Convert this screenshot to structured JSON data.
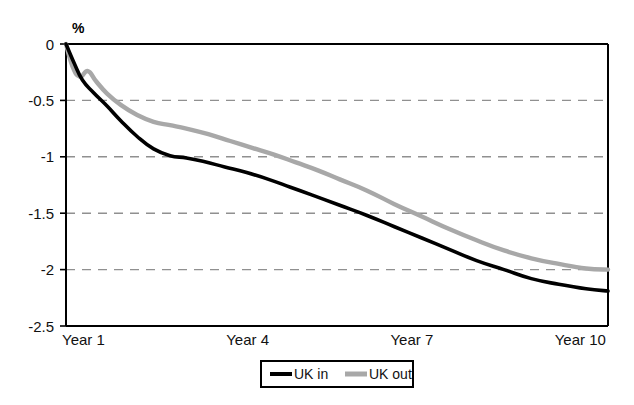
{
  "chart_data": {
    "type": "line",
    "title": "",
    "xlabel": "",
    "ylabel": "%",
    "ylim": [
      -2.5,
      0
    ],
    "xlim": [
      1,
      10.9
    ],
    "grid": true,
    "grid_axis": "y",
    "legend_position": "bottom-center",
    "ytick_labels": [
      "0",
      "-0.5",
      "-1",
      "-1.5",
      "-2",
      "-2.5"
    ],
    "ytick_values": [
      0,
      -0.5,
      -1,
      -1.5,
      -2,
      -2.5
    ],
    "xtick_labels": [
      "Year 1",
      "Year 4",
      "Year 7",
      "Year 10"
    ],
    "xtick_values": [
      1,
      4,
      7,
      10
    ],
    "series": [
      {
        "name": "UK in",
        "color": "#000000",
        "x": [
          1.0,
          1.15,
          1.3,
          1.5,
          1.75,
          2.0,
          2.3,
          2.6,
          2.9,
          3.2,
          3.5,
          3.9,
          4.3,
          4.7,
          5.1,
          5.5,
          6.0,
          6.5,
          7.0,
          7.5,
          8.0,
          8.5,
          9.0,
          9.5,
          10.0,
          10.5,
          10.9
        ],
        "values": [
          0.0,
          -0.17,
          -0.32,
          -0.43,
          -0.55,
          -0.68,
          -0.82,
          -0.93,
          -0.99,
          -1.01,
          -1.04,
          -1.09,
          -1.14,
          -1.2,
          -1.27,
          -1.34,
          -1.43,
          -1.52,
          -1.62,
          -1.72,
          -1.82,
          -1.92,
          -2.0,
          -2.08,
          -2.13,
          -2.17,
          -2.19
        ]
      },
      {
        "name": "UK out",
        "color": "#a8a8a8",
        "x": [
          1.0,
          1.12,
          1.25,
          1.4,
          1.55,
          1.75,
          2.0,
          2.3,
          2.6,
          2.9,
          3.2,
          3.6,
          4.0,
          4.4,
          4.8,
          5.2,
          5.6,
          6.0,
          6.5,
          7.0,
          7.5,
          8.0,
          8.5,
          9.0,
          9.5,
          10.0,
          10.5,
          10.9
        ],
        "values": [
          0.0,
          -0.2,
          -0.29,
          -0.24,
          -0.33,
          -0.44,
          -0.54,
          -0.63,
          -0.69,
          -0.72,
          -0.75,
          -0.8,
          -0.86,
          -0.92,
          -0.98,
          -1.05,
          -1.12,
          -1.2,
          -1.3,
          -1.42,
          -1.53,
          -1.64,
          -1.74,
          -1.83,
          -1.9,
          -1.95,
          -1.99,
          -2.0
        ]
      }
    ]
  },
  "legend": {
    "items": [
      {
        "label": "UK in",
        "color": "#000000"
      },
      {
        "label": "UK out",
        "color": "#a8a8a8"
      }
    ]
  },
  "axis": {
    "y_title": "%"
  }
}
